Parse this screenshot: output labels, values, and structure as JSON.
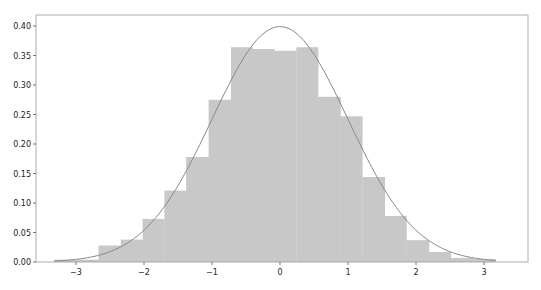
{
  "chart_data": {
    "type": "bar",
    "title": "",
    "xlabel": "",
    "ylabel": "",
    "xlim": [
      -3.5,
      3.6
    ],
    "ylim": [
      0.0,
      0.415
    ],
    "grid": false,
    "legend": null,
    "bar_color": "#c8c8c8",
    "curve_color": "#888888",
    "bin_edges": [
      -3.32,
      -2.99,
      -2.67,
      -2.34,
      -2.02,
      -1.7,
      -1.38,
      -1.05,
      -0.72,
      -0.4,
      -0.08,
      0.24,
      0.56,
      0.89,
      1.21,
      1.54,
      1.86,
      2.19,
      2.51,
      2.84,
      3.17
    ],
    "values": [
      0.004,
      0.004,
      0.028,
      0.038,
      0.073,
      0.121,
      0.178,
      0.275,
      0.364,
      0.361,
      0.358,
      0.364,
      0.28,
      0.247,
      0.144,
      0.078,
      0.037,
      0.017,
      0.007,
      0.005
    ],
    "overlay": {
      "type": "line",
      "name": "normal pdf",
      "mu": 0,
      "sigma": 1
    },
    "xticks": [
      -3,
      -2,
      -1,
      0,
      1,
      2,
      3
    ],
    "xtick_labels": [
      "−3",
      "−2",
      "−1",
      "0",
      "1",
      "2",
      "3"
    ],
    "yticks": [
      0.0,
      0.05,
      0.1,
      0.15,
      0.2,
      0.25,
      0.3,
      0.35,
      0.4
    ],
    "ytick_labels": [
      "0.00",
      "0.05",
      "0.10",
      "0.15",
      "0.20",
      "0.25",
      "0.30",
      "0.35",
      "0.40"
    ]
  }
}
